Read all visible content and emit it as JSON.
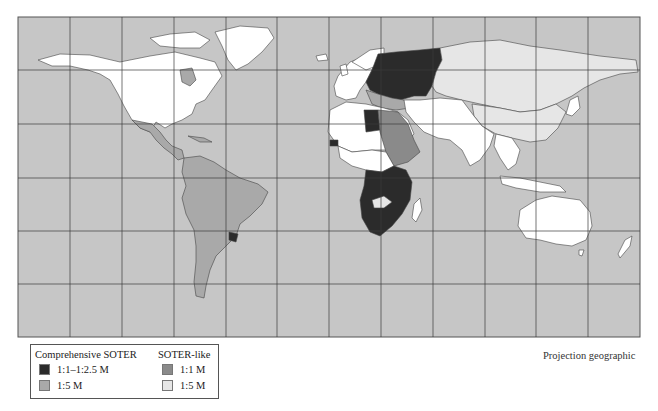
{
  "map": {
    "projection_label": "Projection geographic",
    "colors": {
      "ocean": "#c6c6c6",
      "grid": "#3a3a3a",
      "border": "#444444",
      "comprehensive_1_1_to_1_2_5M": "#2b2b2b",
      "comprehensive_1_5M": "#a9a9a9",
      "soter_like_1_1M": "#8a8a8a",
      "soter_like_1_5M": "#e6e6e6",
      "no_data": "#ffffff"
    }
  },
  "legend": {
    "comprehensive": {
      "title": "Comprehensive SOTER",
      "items": [
        {
          "label": "1:1–1:2.5 M",
          "color": "#2b2b2b"
        },
        {
          "label": "1:5 M",
          "color": "#a9a9a9"
        }
      ]
    },
    "soter_like": {
      "title": "SOTER-like",
      "items": [
        {
          "label": "1:1 M",
          "color": "#8a8a8a"
        },
        {
          "label": "1:5 M",
          "color": "#e6e6e6"
        }
      ]
    }
  }
}
